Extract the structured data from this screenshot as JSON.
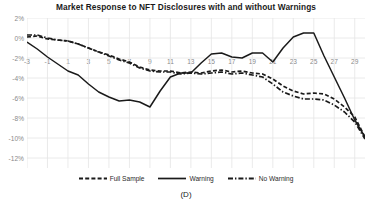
{
  "chart_data": {
    "type": "line",
    "title": "Market Response to NFT Disclosures with and without Warnings",
    "xlabel": "",
    "ylabel": "",
    "panel_label": "(D)",
    "grid": true,
    "legend_position": "bottom",
    "ylim": [
      -13,
      2
    ],
    "xlim": [
      -3,
      30
    ],
    "ytick_labels": [
      "2%",
      "0%",
      "-2%",
      "-4%",
      "-6%",
      "-8%",
      "-10%",
      "-12%"
    ],
    "ytick_values": [
      2,
      0,
      -2,
      -4,
      -6,
      -8,
      -10,
      -12
    ],
    "xtick_labels": [
      "-3",
      "-1",
      "1",
      "3",
      "5",
      "7",
      "9",
      "11",
      "13",
      "15",
      "17",
      "19",
      "21",
      "23",
      "25",
      "27",
      "29"
    ],
    "xtick_values": [
      -3,
      -1,
      1,
      3,
      5,
      7,
      9,
      11,
      13,
      15,
      17,
      19,
      21,
      23,
      25,
      27,
      29
    ],
    "x": [
      -3,
      -2,
      -1,
      0,
      1,
      2,
      3,
      4,
      5,
      6,
      7,
      8,
      9,
      10,
      11,
      12,
      13,
      14,
      15,
      16,
      17,
      18,
      19,
      20,
      21,
      22,
      23,
      24,
      25,
      26,
      27,
      28,
      29,
      30
    ],
    "series": [
      {
        "name": "Full Sample",
        "style": "dashed",
        "color": "#1a1a1a",
        "values": [
          0.1,
          0.2,
          -0.1,
          -0.2,
          -0.3,
          -0.6,
          -1.0,
          -1.4,
          -1.7,
          -2.1,
          -2.4,
          -2.9,
          -3.2,
          -3.3,
          -3.3,
          -3.5,
          -3.4,
          -3.5,
          -3.3,
          -3.2,
          -3.4,
          -3.3,
          -3.5,
          -3.6,
          -4.1,
          -4.8,
          -5.3,
          -5.6,
          -5.5,
          -5.6,
          -6.1,
          -6.9,
          -7.9,
          -9.9
        ]
      },
      {
        "name": "Warning",
        "style": "solid",
        "color": "#1a1a1a",
        "values": [
          -0.4,
          -1.1,
          -1.9,
          -2.6,
          -3.3,
          -3.7,
          -4.6,
          -5.4,
          -5.9,
          -6.3,
          -6.2,
          -6.4,
          -6.9,
          -5.3,
          -3.9,
          -3.5,
          -3.5,
          -2.5,
          -1.6,
          -1.5,
          -1.9,
          -2.0,
          -1.5,
          -1.5,
          -2.4,
          -1.0,
          0.1,
          0.5,
          0.5,
          -1.8,
          -3.9,
          -6.0,
          -8.2,
          -9.9
        ]
      },
      {
        "name": "No Warning",
        "style": "dashdot",
        "color": "#1a1a1a",
        "values": [
          0.3,
          0.3,
          0.0,
          -0.2,
          -0.3,
          -0.6,
          -1.0,
          -1.4,
          -1.8,
          -2.2,
          -2.5,
          -3.0,
          -3.3,
          -3.4,
          -3.4,
          -3.6,
          -3.5,
          -3.6,
          -3.5,
          -3.4,
          -3.6,
          -3.5,
          -3.7,
          -3.9,
          -4.6,
          -5.4,
          -5.8,
          -6.1,
          -6.1,
          -6.2,
          -6.7,
          -7.4,
          -8.4,
          -10.1
        ]
      }
    ]
  }
}
